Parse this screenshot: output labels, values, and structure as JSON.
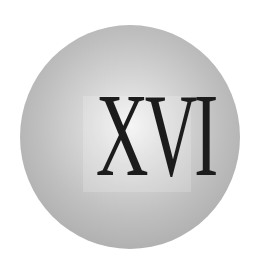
{
  "emblem": {
    "numeral": "XVI",
    "colors": {
      "sphere_highlight": "#f4f4f4",
      "sphere_edge": "#a0a0a0",
      "text": "#1c1c1c",
      "background": "#ffffff"
    }
  }
}
